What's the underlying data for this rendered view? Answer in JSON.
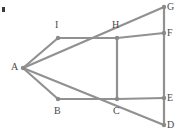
{
  "figure": {
    "type": "geometry-graph-diagram",
    "width": 177,
    "height": 133,
    "background_color": "#ffffff",
    "edge_color": "#919191",
    "node_color": "#8a8a8a",
    "label_color": "#4a4a4a",
    "edge_width": 2.2,
    "node_radius": 2.2,
    "corner_mark": {
      "present": true,
      "x": 2,
      "y": 7,
      "width": 3,
      "height": 5,
      "color": "#3a3a3a"
    },
    "vertices": [
      {
        "id": "A",
        "label": "A",
        "x": 23,
        "y": 68,
        "label_x": 11,
        "label_y": 62
      },
      {
        "id": "B",
        "label": "B",
        "x": 58,
        "y": 99,
        "label_x": 54,
        "label_y": 106
      },
      {
        "id": "C",
        "label": "C",
        "x": 117,
        "y": 99,
        "label_x": 113,
        "label_y": 106
      },
      {
        "id": "D",
        "label": "D",
        "x": 164,
        "y": 125,
        "label_x": 167,
        "label_y": 120
      },
      {
        "id": "E",
        "label": "E",
        "x": 164,
        "y": 98,
        "label_x": 167,
        "label_y": 93
      },
      {
        "id": "F",
        "label": "F",
        "x": 164,
        "y": 33,
        "label_x": 167,
        "label_y": 28
      },
      {
        "id": "G",
        "label": "G",
        "x": 164,
        "y": 7,
        "label_x": 167,
        "label_y": 2
      },
      {
        "id": "H",
        "label": "H",
        "x": 117,
        "y": 38,
        "label_x": 112,
        "label_y": 20
      },
      {
        "id": "I",
        "label": "I",
        "x": 58,
        "y": 38,
        "label_x": 55,
        "label_y": 20
      }
    ],
    "edges": [
      {
        "from": "A",
        "to": "I",
        "name": "edge-a-i"
      },
      {
        "from": "A",
        "to": "B",
        "name": "edge-a-b"
      },
      {
        "from": "A",
        "to": "G",
        "name": "edge-a-g"
      },
      {
        "from": "A",
        "to": "D",
        "name": "edge-a-d"
      },
      {
        "from": "I",
        "to": "H",
        "name": "edge-i-h"
      },
      {
        "from": "B",
        "to": "C",
        "name": "edge-b-c"
      },
      {
        "from": "H",
        "to": "F",
        "name": "edge-h-f"
      },
      {
        "from": "C",
        "to": "E",
        "name": "edge-c-e"
      },
      {
        "from": "H",
        "to": "C",
        "name": "edge-h-c"
      },
      {
        "from": "G",
        "to": "F",
        "name": "edge-g-f"
      },
      {
        "from": "F",
        "to": "E",
        "name": "edge-f-e"
      },
      {
        "from": "E",
        "to": "D",
        "name": "edge-e-d"
      }
    ]
  }
}
